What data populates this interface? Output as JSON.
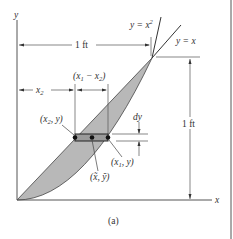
{
  "figure": {
    "caption": "(a)",
    "axes": {
      "x_label": "x",
      "y_label": "y"
    },
    "curves": [
      {
        "name": "parabola",
        "label": "y = x",
        "label_sup": "2"
      },
      {
        "name": "line",
        "label": "y = x"
      }
    ],
    "dimensions": {
      "width_label": "1 ft",
      "height_label": "1 ft",
      "x2_label": "x",
      "x2_sub": "2",
      "diff_label_open": "(x",
      "diff_sub1": "1",
      "diff_mid": " − x",
      "diff_sub2": "2",
      "diff_close": ")",
      "dy_label": "dy"
    },
    "points": {
      "left": {
        "open": "(x",
        "sub": "2",
        "close": ", y)"
      },
      "right": {
        "open": "(x",
        "sub": "1",
        "close": ", y)"
      },
      "centroid": "(x̃, ỹ)"
    },
    "colors": {
      "shade": "#b8b8b8",
      "line": "#333333",
      "border": "#555555"
    }
  }
}
